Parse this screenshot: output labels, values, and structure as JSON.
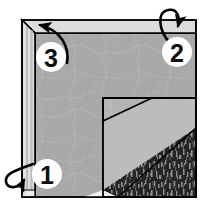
{
  "figure": {
    "canvas": {
      "width": 206,
      "height": 211,
      "background": "#ffffff"
    },
    "colors": {
      "outline": "#000000",
      "panel_face": "#a9a9a9",
      "top_bevel": "#dcdcdc",
      "left_bevel_light": "#e2e2e2",
      "left_bevel_dark": "#bdbdbd",
      "inner_panel": "#b6b6b6",
      "inner_band": "#b9b9b9",
      "dark_texture": "#2b2b2b",
      "dark_texture_speck": "#8d8d8d",
      "label_circle_fill": "#ffffff",
      "label_text": "#101010",
      "paper_white": "#f2f2f2"
    },
    "shapes": [
      {
        "name": "main-panel-face",
        "role": "large mottled gray sheet face"
      },
      {
        "name": "top-edge-bevel",
        "role": "light gray folded top band"
      },
      {
        "name": "left-edge-bevel",
        "role": "light gray folded left vertical band"
      },
      {
        "name": "inner-panel",
        "role": "inset rectangle lower right"
      },
      {
        "name": "inner-diagonal-band",
        "role": "light diagonal band across inset"
      },
      {
        "name": "dark-textured-corner",
        "role": "dark speckled fabric corner"
      }
    ],
    "labels": [
      {
        "id": "label-1",
        "text": "1",
        "cx": 47,
        "cy": 174,
        "r": 15,
        "arrow": "hook-loop-around-left-edge",
        "arrow_direction": "counter-clockwise-around-left-strip"
      },
      {
        "id": "label-2",
        "text": "2",
        "cx": 177,
        "cy": 52,
        "r": 15,
        "arrow": "hook-loop-over-top-edge",
        "arrow_direction": "clockwise-over-top-strip"
      },
      {
        "id": "label-3",
        "text": "3",
        "cx": 51,
        "cy": 57,
        "r": 15,
        "arrow": "curved-arrow-to-top-left-corner",
        "arrow_direction": "up-and-left-toward-corner"
      }
    ]
  }
}
